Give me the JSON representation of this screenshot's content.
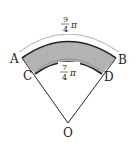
{
  "diagram": {
    "points": {
      "A": "A",
      "B": "B",
      "C": "C",
      "D": "D",
      "O": "O"
    },
    "outer_arc": {
      "numerator": "9",
      "denominator": "4",
      "symbol": "π"
    },
    "inner_arc": {
      "numerator": "7",
      "denominator": "4",
      "symbol": "π"
    },
    "colors": {
      "shaded_region": "#b3b3b3",
      "lines": "#222222"
    }
  }
}
